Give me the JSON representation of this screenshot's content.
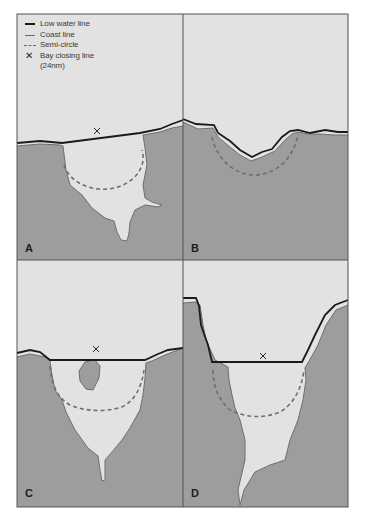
{
  "legend": {
    "items": [
      {
        "symbol": "solid-black-line",
        "label": "Low water line"
      },
      {
        "symbol": "solid-grey-line",
        "label": "Coast line"
      },
      {
        "symbol": "dashed-grey-line",
        "label": "Semi-circle"
      },
      {
        "symbol": "x-mark",
        "label": "Bay closing line"
      },
      {
        "symbol": "none",
        "label": "(24nm)"
      }
    ]
  },
  "panels": [
    {
      "id": "A",
      "label": "A"
    },
    {
      "id": "B",
      "label": "B"
    },
    {
      "id": "C",
      "label": "C"
    },
    {
      "id": "D",
      "label": "D"
    }
  ],
  "colors": {
    "sea": "#e2e2e2",
    "land": "#9d9d9d",
    "low_water_line": "#1a1a1a",
    "coast_line": "#6e6e6e",
    "semi_circle": "#6e6e6e",
    "frame": "#555555"
  }
}
